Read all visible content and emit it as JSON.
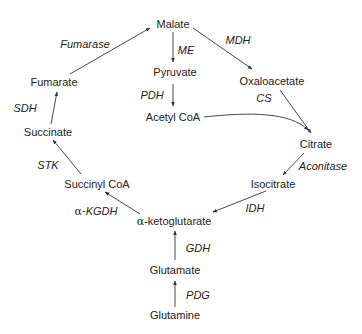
{
  "diagram": {
    "title": "",
    "metabolites": {
      "malate": "Malate",
      "pyruvate": "Pyruvate",
      "acetyl_coa": "Acetyl CoA",
      "oxaloacetate": "Oxaloacetate",
      "citrate": "Citrate",
      "isocitrate": "Isocitrate",
      "alpha_ketoglutarate": "α-ketoglutarate",
      "succinyl_coa": "Succinyl CoA",
      "succinate": "Succinate",
      "fumarate": "Fumarate",
      "glutamate": "Glutamate",
      "glutamine": "Glutamine"
    },
    "enzymes": {
      "fumarase": "Fumarase",
      "me": "ME",
      "mdh": "MDH",
      "pdh": "PDH",
      "cs": "CS",
      "aconitase": "Aconitase",
      "idh": "IDH",
      "akgdh_prefix": "α-",
      "akgdh": "KGDH",
      "stk": "STK",
      "sdh": "SDH",
      "gdh": "GDH",
      "pdg": "PDG"
    },
    "edges": [
      {
        "from": "Malate",
        "to": "Pyruvate",
        "enzyme": "ME"
      },
      {
        "from": "Malate",
        "to": "Oxaloacetate",
        "enzyme": "MDH"
      },
      {
        "from": "Pyruvate",
        "to": "Acetyl CoA",
        "enzyme": "PDH"
      },
      {
        "from": "Oxaloacetate",
        "to": "Citrate",
        "enzyme": "CS"
      },
      {
        "from": "Acetyl CoA",
        "to": "Citrate",
        "enzyme": "CS"
      },
      {
        "from": "Citrate",
        "to": "Isocitrate",
        "enzyme": "Aconitase"
      },
      {
        "from": "Isocitrate",
        "to": "α-ketoglutarate",
        "enzyme": "IDH"
      },
      {
        "from": "α-ketoglutarate",
        "to": "Succinyl CoA",
        "enzyme": "α-KGDH"
      },
      {
        "from": "Succinyl CoA",
        "to": "Succinate",
        "enzyme": "STK"
      },
      {
        "from": "Succinate",
        "to": "Fumarate",
        "enzyme": "SDH"
      },
      {
        "from": "Fumarate",
        "to": "Malate",
        "enzyme": "Fumarase"
      },
      {
        "from": "Glutamate",
        "to": "α-ketoglutarate",
        "enzyme": "GDH"
      },
      {
        "from": "Glutamine",
        "to": "Glutamate",
        "enzyme": "PDG"
      }
    ],
    "colors": {
      "text": "#222222",
      "arrow": "#333333",
      "background": "#ffffff"
    }
  }
}
